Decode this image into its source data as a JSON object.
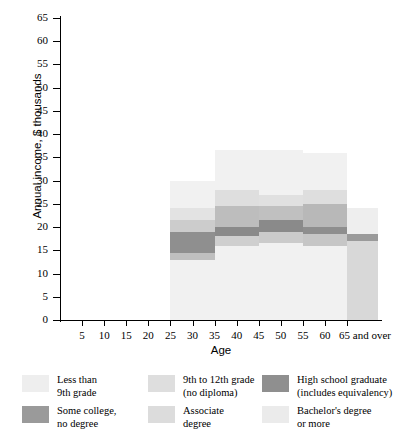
{
  "chart_data": {
    "type": "bar",
    "title": "",
    "subtitle": "",
    "xlabel": "Age",
    "ylabel": "Annual income, $ thousands",
    "ylim": [
      0,
      65
    ],
    "ytick_step": 5,
    "yticks": [
      "0",
      "5",
      "10",
      "15",
      "20",
      "25",
      "30",
      "35",
      "40",
      "45",
      "50",
      "55",
      "60",
      "65"
    ],
    "ytick_values": [
      0,
      5,
      10,
      15,
      20,
      25,
      30,
      35,
      40,
      45,
      50,
      55,
      60,
      65
    ],
    "xticks": [
      "5",
      "10",
      "15",
      "20",
      "25",
      "30",
      "35",
      "40",
      "45",
      "50",
      "55",
      "60",
      "65 and over"
    ],
    "xtick_values": [
      5,
      10,
      15,
      20,
      25,
      30,
      35,
      40,
      45,
      50,
      55,
      60,
      65
    ],
    "xlim": [
      0,
      72
    ],
    "grid": false,
    "legend_position": "bottom",
    "legend": [
      "Less than 9th grade",
      "9th to 12th grade (no diploma)",
      "High school graduate (includes equivalency)",
      "Some college, no degree",
      "Associate degree",
      "Bachelor's degree or more"
    ],
    "series": [
      {
        "name": "Less than 9th grade",
        "color": "#f2f2f2",
        "values": [
          30.0,
          36.5,
          36.5,
          36.0,
          24.0
        ]
      },
      {
        "name": "9th to 12th grade (no diploma)",
        "color": "#e2e2e2",
        "values": [
          24.0,
          28.0,
          27.0,
          28.0,
          24.0
        ]
      },
      {
        "name": "High school graduate (includes equivalency)",
        "color": "#cdcdcd",
        "values": [
          21.5,
          24.5,
          24.5,
          25.0,
          18.5
        ]
      },
      {
        "name": "Some college, no degree",
        "color": "#a8a8a8",
        "values": [
          19.0,
          20.0,
          21.5,
          20.0,
          18.0
        ]
      },
      {
        "name": "Associate degree",
        "color": "#dcdcdc",
        "values": [
          14.5,
          18.0,
          19.0,
          18.5,
          17.5
        ]
      },
      {
        "name": "Bachelor's degree or more",
        "color": "#ebebeb",
        "values": [
          13.0,
          16.0,
          16.5,
          16.0,
          17.0
        ]
      }
    ],
    "categories": [
      "25-35",
      "35-45",
      "45-55",
      "55-65",
      "65 and over"
    ],
    "bars": [
      {
        "label": "25-35",
        "x_start": 25,
        "x_end": 35,
        "bands": [
          {
            "series": "Less than 9th grade",
            "color": "#f1f1f1",
            "top": 30.0,
            "bottom": 0.0
          },
          {
            "series": "9th to 12th grade (no diploma)",
            "color": "#e3e3e3",
            "top": 24.0,
            "bottom": 13.0
          },
          {
            "series": "High school graduate (includes equivalency)",
            "color": "#cccccc",
            "top": 21.5,
            "bottom": 13.0
          },
          {
            "series": "Some college, no degree",
            "color": "#8f8f8f",
            "top": 19.0,
            "bottom": 14.5
          },
          {
            "series": "Associate degree",
            "color": "#bfbfbf",
            "top": 14.5,
            "bottom": 13.0
          }
        ]
      },
      {
        "label": "35-45",
        "x_start": 35,
        "x_end": 45,
        "bands": [
          {
            "series": "Less than 9th grade",
            "color": "#f1f1f1",
            "top": 36.5,
            "bottom": 0.0
          },
          {
            "series": "9th to 12th grade (no diploma)",
            "color": "#dedede",
            "top": 28.0,
            "bottom": 16.0
          },
          {
            "series": "High school graduate (includes equivalency)",
            "color": "#bdbdbd",
            "top": 24.5,
            "bottom": 16.0
          },
          {
            "series": "Some college, no degree",
            "color": "#8a8a8a",
            "top": 20.0,
            "bottom": 18.0
          },
          {
            "series": "Associate degree",
            "color": "#cfcfcf",
            "top": 18.0,
            "bottom": 16.0
          }
        ]
      },
      {
        "label": "45-55",
        "x_start": 45,
        "x_end": 55,
        "bands": [
          {
            "series": "Less than 9th grade",
            "color": "#f1f1f1",
            "top": 36.5,
            "bottom": 0.0
          },
          {
            "series": "9th to 12th grade (no diploma)",
            "color": "#e0e0e0",
            "top": 27.0,
            "bottom": 16.5
          },
          {
            "series": "High school graduate (includes equivalency)",
            "color": "#c0c0c0",
            "top": 24.5,
            "bottom": 16.5
          },
          {
            "series": "Some college, no degree",
            "color": "#8a8a8a",
            "top": 21.5,
            "bottom": 19.0
          },
          {
            "series": "Associate degree",
            "color": "#cbcbcb",
            "top": 19.0,
            "bottom": 16.5
          }
        ]
      },
      {
        "label": "55-65",
        "x_start": 55,
        "x_end": 65,
        "bands": [
          {
            "series": "Less than 9th grade",
            "color": "#f1f1f1",
            "top": 36.0,
            "bottom": 0.0
          },
          {
            "series": "9th to 12th grade (no diploma)",
            "color": "#dedede",
            "top": 28.0,
            "bottom": 16.0
          },
          {
            "series": "High school graduate (includes equivalency)",
            "color": "#b8b8b8",
            "top": 25.0,
            "bottom": 16.0
          },
          {
            "series": "Some college, no degree",
            "color": "#8e8e8e",
            "top": 20.0,
            "bottom": 18.5
          },
          {
            "series": "Associate degree",
            "color": "#c6c6c6",
            "top": 18.5,
            "bottom": 16.0
          }
        ]
      },
      {
        "label": "65 and over",
        "x_start": 65,
        "x_end": 72,
        "bands": [
          {
            "series": "Less than 9th grade",
            "color": "#eeeeee",
            "top": 24.0,
            "bottom": 0.0
          },
          {
            "series": "9th to 12th grade (no diploma)",
            "color": "#d8d8d8",
            "top": 18.5,
            "bottom": 0.0
          },
          {
            "series": "Some college, no degree",
            "color": "#9a9a9a",
            "top": 18.5,
            "bottom": 17.0
          }
        ]
      }
    ]
  },
  "legend_items": [
    {
      "label_line1": "Less than",
      "label_line2": "9th grade",
      "color": "#eeeeee"
    },
    {
      "label_line1": "9th to 12th grade",
      "label_line2": "(no diploma)",
      "color": "#dedede"
    },
    {
      "label_line1": "High school graduate",
      "label_line2": "(includes equivalency)",
      "color": "#8f8f8f"
    },
    {
      "label_line1": "Some college,",
      "label_line2": "no degree",
      "color": "#9a9a9a"
    },
    {
      "label_line1": "Associate",
      "label_line2": "degree",
      "color": "#dcdcdc"
    },
    {
      "label_line1": "Bachelor's degree",
      "label_line2": "or more",
      "color": "#ebebeb"
    }
  ]
}
